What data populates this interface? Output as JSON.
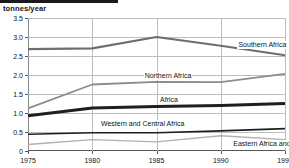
{
  "figure": {
    "unit_label": "tonnes/year",
    "top_rule": "black-rule"
  },
  "chart_data": {
    "type": "line",
    "title": "",
    "subtitle": "",
    "xlabel": "",
    "ylabel": "tonnes/year",
    "x": [
      1975,
      1980,
      1985,
      1990,
      1995
    ],
    "xtick_labels": [
      "1975",
      "1980",
      "1985",
      "1990",
      "1995"
    ],
    "ytick_labels": [
      "0",
      "0.5",
      "1.0",
      "1.5",
      "2.0",
      "2.5",
      "3.0",
      "3.5"
    ],
    "ytick_values": [
      0,
      0.5,
      1.0,
      1.5,
      2.0,
      2.5,
      3.0,
      3.5
    ],
    "xlim": [
      1975,
      1995
    ],
    "ylim": [
      0,
      3.5
    ],
    "grid": true,
    "legend_position": "inline-annotations",
    "series": [
      {
        "name": "Southern Africa",
        "values": [
          2.68,
          2.7,
          3.0,
          2.77,
          2.52
        ],
        "color": "#6e6e6e",
        "width": 2.2,
        "label_x": 1991.3,
        "label_y": 2.78
      },
      {
        "name": "Northern Africa",
        "values": [
          1.12,
          1.75,
          1.82,
          1.81,
          2.03
        ],
        "color": "#8c8c8c",
        "width": 1.8,
        "label_x": 1984.0,
        "label_y": 1.98
      },
      {
        "name": "Africa",
        "values": [
          0.93,
          1.13,
          1.17,
          1.2,
          1.25
        ],
        "color": "#1f1f1f",
        "width": 3.0,
        "label_x": 1985.2,
        "label_y": 1.34
      },
      {
        "name": "Western and Central Africa",
        "values": [
          0.44,
          0.48,
          0.48,
          0.53,
          0.59
        ],
        "color": "#1f1f1f",
        "width": 1.6,
        "label_x": 1980.6,
        "label_y": 0.7
      },
      {
        "name": "Eastern Africa and Indian Ocean Islands",
        "values": [
          0.17,
          0.3,
          0.24,
          0.4,
          0.3
        ],
        "color": "#b0b0b0",
        "width": 1.4,
        "label_x": 1990.9,
        "label_y": 0.19
      }
    ]
  }
}
